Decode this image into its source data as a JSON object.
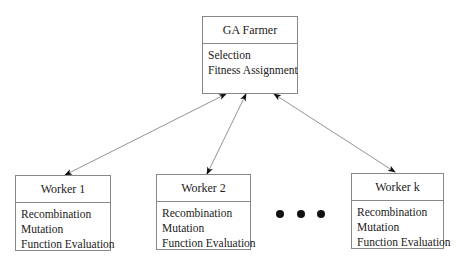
{
  "farmer": {
    "title": "GA Farmer",
    "tasks": [
      "Selection",
      "Fitness Assignment"
    ]
  },
  "workers": [
    {
      "title": "Worker 1",
      "tasks": [
        "Recombination",
        "Mutation",
        "Function Evaluation"
      ]
    },
    {
      "title": "Worker 2",
      "tasks": [
        "Recombination",
        "Mutation",
        "Function Evaluation"
      ]
    },
    {
      "title": "Worker k",
      "tasks": [
        "Recombination",
        "Mutation",
        "Function Evaluation"
      ]
    }
  ],
  "ellipsis_dots": 3,
  "connector_style": "bidirectional-arrow"
}
